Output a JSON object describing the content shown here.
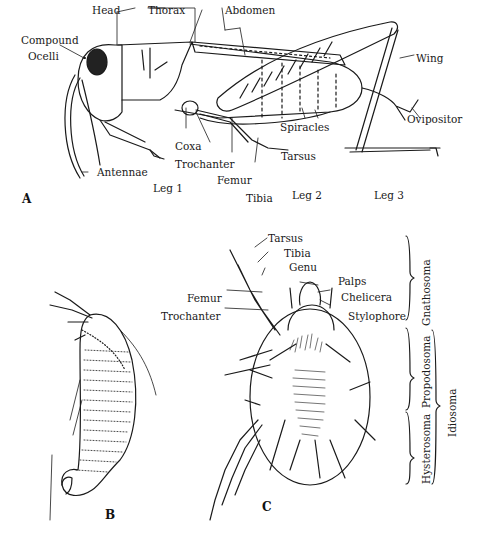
{
  "figure": {
    "panels": {
      "A": {
        "letter": "A",
        "subject": "grasshopper",
        "labels": {
          "head": "Head",
          "thorax": "Thorax",
          "abdomen": "Abdomen",
          "compound": "Compound",
          "ocelli": "Ocelli",
          "wing": "Wing",
          "spiracles": "Spiracles",
          "ovipositor": "Ovipositor",
          "coxa": "Coxa",
          "trochanter": "Trochanter",
          "antennae": "Antennae",
          "femur": "Femur",
          "tibia": "Tibia",
          "tarsus": "Tarsus",
          "leg1": "Leg 1",
          "leg2": "Leg 2",
          "leg3": "Leg 3"
        }
      },
      "B": {
        "letter": "B",
        "subject": "elongated mite (lateral view)"
      },
      "C": {
        "letter": "C",
        "subject": "mite (dorsal view)",
        "labels": {
          "tarsus": "Tarsus",
          "tibia": "Tibia",
          "genu": "Genu",
          "palps": "Palps",
          "femur": "Femur",
          "chelicera": "Chelicera",
          "trochanter": "Trochanter",
          "stylophore": "Stylophore"
        },
        "body_regions": {
          "gnathosoma": "Gnathosoma",
          "propodosoma": "Propodosoma",
          "hysterosoma": "Hysterosoma",
          "idiosoma": "Idiosoma"
        }
      }
    }
  }
}
